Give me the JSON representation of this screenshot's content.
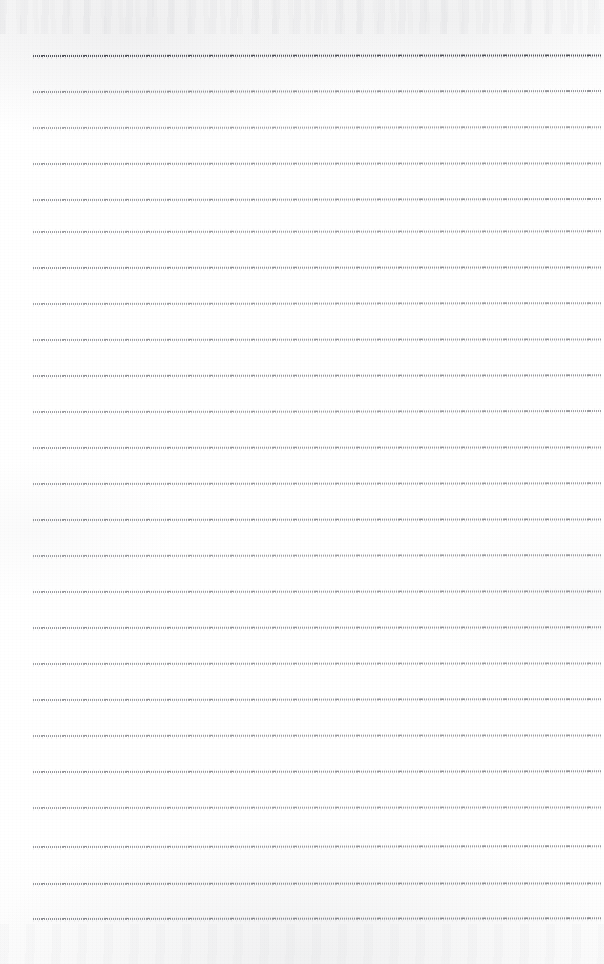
{
  "document": {
    "kind": "scanned-blank-ruled-page",
    "title": "Scanned Ruled Page",
    "page_width": 604,
    "page_height": 964,
    "background_color": "#fdfdfd",
    "paper_tone": "#ffffff",
    "text_content": "",
    "has_handwriting": false,
    "has_printed_text": false
  },
  "ruling": {
    "style": "dotted-dashed horizontal rules",
    "ink_color": "#373942",
    "line_count": 25,
    "left_margin_x": 33,
    "right_end_x": 601,
    "first_line_y": 56,
    "last_line_y": 919,
    "line_spacing": 35.96,
    "vertical_margin_rule": false,
    "lines": [
      {
        "index": 1,
        "y": 56,
        "x_start": 33,
        "x_end": 601,
        "opacity": 1.0,
        "tilt_deg": -0.05
      },
      {
        "index": 2,
        "y": 92,
        "x_start": 33,
        "x_end": 601,
        "opacity": 0.62,
        "tilt_deg": -0.1
      },
      {
        "index": 3,
        "y": 128,
        "x_start": 33,
        "x_end": 601,
        "opacity": 0.55,
        "tilt_deg": -0.08
      },
      {
        "index": 4,
        "y": 164,
        "x_start": 33,
        "x_end": 601,
        "opacity": 0.58,
        "tilt_deg": -0.06
      },
      {
        "index": 5,
        "y": 200,
        "x_start": 33,
        "x_end": 601,
        "opacity": 0.6,
        "tilt_deg": -0.09
      },
      {
        "index": 6,
        "y": 232,
        "x_start": 33,
        "x_end": 601,
        "opacity": 0.57,
        "tilt_deg": -0.07
      },
      {
        "index": 7,
        "y": 268,
        "x_start": 33,
        "x_end": 601,
        "opacity": 0.63,
        "tilt_deg": -0.05
      },
      {
        "index": 8,
        "y": 304,
        "x_start": 33,
        "x_end": 601,
        "opacity": 0.56,
        "tilt_deg": -0.08
      },
      {
        "index": 9,
        "y": 340,
        "x_start": 33,
        "x_end": 601,
        "opacity": 0.59,
        "tilt_deg": -0.06
      },
      {
        "index": 10,
        "y": 376,
        "x_start": 33,
        "x_end": 601,
        "opacity": 0.61,
        "tilt_deg": -0.07
      },
      {
        "index": 11,
        "y": 412,
        "x_start": 33,
        "x_end": 601,
        "opacity": 0.57,
        "tilt_deg": -0.09
      },
      {
        "index": 12,
        "y": 448,
        "x_start": 33,
        "x_end": 601,
        "opacity": 0.6,
        "tilt_deg": -0.05
      },
      {
        "index": 13,
        "y": 484,
        "x_start": 33,
        "x_end": 601,
        "opacity": 0.58,
        "tilt_deg": -0.07
      },
      {
        "index": 14,
        "y": 520,
        "x_start": 33,
        "x_end": 601,
        "opacity": 0.62,
        "tilt_deg": -0.06
      },
      {
        "index": 15,
        "y": 556,
        "x_start": 33,
        "x_end": 601,
        "opacity": 0.56,
        "tilt_deg": -0.08
      },
      {
        "index": 16,
        "y": 592,
        "x_start": 33,
        "x_end": 601,
        "opacity": 0.59,
        "tilt_deg": -0.05
      },
      {
        "index": 17,
        "y": 628,
        "x_start": 33,
        "x_end": 601,
        "opacity": 0.61,
        "tilt_deg": -0.07
      },
      {
        "index": 18,
        "y": 664,
        "x_start": 33,
        "x_end": 601,
        "opacity": 0.57,
        "tilt_deg": -0.06
      },
      {
        "index": 19,
        "y": 700,
        "x_start": 33,
        "x_end": 601,
        "opacity": 0.6,
        "tilt_deg": -0.08
      },
      {
        "index": 20,
        "y": 736,
        "x_start": 33,
        "x_end": 601,
        "opacity": 0.58,
        "tilt_deg": -0.05
      },
      {
        "index": 21,
        "y": 772,
        "x_start": 33,
        "x_end": 601,
        "opacity": 0.62,
        "tilt_deg": -0.07
      },
      {
        "index": 22,
        "y": 808,
        "x_start": 33,
        "x_end": 601,
        "opacity": 0.57,
        "tilt_deg": -0.06
      },
      {
        "index": 23,
        "y": 847,
        "x_start": 33,
        "x_end": 601,
        "opacity": 0.6,
        "tilt_deg": -0.08
      },
      {
        "index": 24,
        "y": 884,
        "x_start": 33,
        "x_end": 601,
        "opacity": 0.63,
        "tilt_deg": -0.05
      },
      {
        "index": 25,
        "y": 919,
        "x_start": 33,
        "x_end": 601,
        "opacity": 0.66,
        "tilt_deg": -0.07
      }
    ]
  }
}
